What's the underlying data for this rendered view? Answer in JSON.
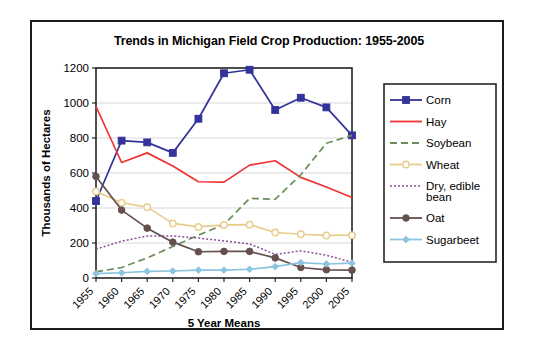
{
  "figure": {
    "title": "Trends in Michigan Field Crop Production: 1955-2005",
    "border_color": "#1c1c1c",
    "background": "#ffffff"
  },
  "chart_data": {
    "type": "line",
    "title": "Trends in Michigan Field Crop Production: 1955-2005",
    "xlabel": "5 Year Means",
    "ylabel": "Thousands of Hectares",
    "categories": [
      "1955",
      "1960",
      "1965",
      "1970",
      "1975",
      "1980",
      "1985",
      "1990",
      "1995",
      "2000",
      "2005"
    ],
    "ylim": [
      0,
      1200
    ],
    "yticks": [
      0,
      200,
      400,
      600,
      800,
      1000,
      1200
    ],
    "grid": "horizontal",
    "legend_position": "right",
    "series": [
      {
        "name": "Corn",
        "color": "#333399",
        "marker": "square-filled",
        "dash": "solid",
        "values": [
          440,
          785,
          775,
          715,
          910,
          1170,
          1190,
          960,
          1030,
          975,
          815
        ]
      },
      {
        "name": "Hay",
        "color": "#ee3333",
        "marker": "none",
        "dash": "solid",
        "values": [
          980,
          660,
          715,
          640,
          550,
          548,
          645,
          670,
          575,
          520,
          460
        ]
      },
      {
        "name": "Soybean",
        "color": "#6b8e5a",
        "marker": "none",
        "dash": "dashed",
        "values": [
          35,
          60,
          115,
          180,
          245,
          305,
          455,
          450,
          590,
          770,
          815
        ]
      },
      {
        "name": "Wheat",
        "color": "#e8cd8a",
        "marker": "circle-open",
        "dash": "solid",
        "values": [
          495,
          430,
          405,
          312,
          292,
          303,
          305,
          260,
          250,
          243,
          245
        ]
      },
      {
        "name": "Dry, edible bean",
        "color": "#8b4f99",
        "marker": "none",
        "dash": "dotted",
        "values": [
          165,
          210,
          240,
          240,
          228,
          212,
          195,
          135,
          155,
          130,
          90
        ]
      },
      {
        "name": "Oat",
        "color": "#66504f",
        "marker": "circle-filled",
        "dash": "solid",
        "values": [
          580,
          388,
          285,
          205,
          150,
          152,
          152,
          115,
          60,
          47,
          45
        ]
      },
      {
        "name": "Sugarbeet",
        "color": "#8dc4e0",
        "marker": "diamond-filled",
        "dash": "solid",
        "values": [
          25,
          30,
          38,
          40,
          45,
          45,
          50,
          65,
          88,
          80,
          85
        ]
      }
    ]
  },
  "legend": {
    "items": [
      {
        "label": "Corn"
      },
      {
        "label": "Hay"
      },
      {
        "label": "Soybean"
      },
      {
        "label": "Wheat"
      },
      {
        "label": "Dry, edible"
      },
      {
        "label": "bean"
      },
      {
        "label": "Oat"
      },
      {
        "label": "Sugarbeet"
      }
    ]
  }
}
